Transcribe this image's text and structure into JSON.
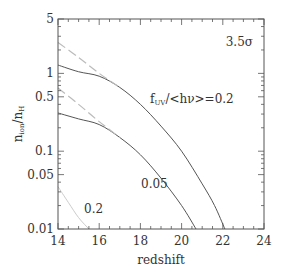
{
  "chart_data": {
    "type": "line",
    "title": "",
    "xlabel": "redshift",
    "ylabel": "n_ion/n_H",
    "xlim": [
      14,
      24
    ],
    "ylim": [
      0.01,
      5
    ],
    "yscale": "log",
    "grid": false,
    "x_ticks": [
      14,
      16,
      18,
      20,
      22,
      24
    ],
    "x_tick_labels": [
      "14",
      "16",
      "18",
      "20",
      "22",
      "24"
    ],
    "y_ticks": [
      0.01,
      0.05,
      0.1,
      0.5,
      1,
      5
    ],
    "y_tick_labels": [
      "0.01",
      "0.05",
      "0.1",
      "0.5",
      "1",
      "5"
    ],
    "annotations": {
      "sigma": "3.5σ",
      "param": "f_UV/<hν>=0.2",
      "label_005": "0.05",
      "label_02": "0.2"
    },
    "series": [
      {
        "name": "f=0.2 solid",
        "style": "solid",
        "color": "#555555",
        "x": [
          14,
          15,
          16,
          17,
          18,
          19,
          20,
          21,
          21.6,
          22.1
        ],
        "y": [
          1.28,
          1.05,
          0.92,
          0.66,
          0.4,
          0.21,
          0.1,
          0.038,
          0.02,
          0.01
        ]
      },
      {
        "name": "f=0.2 dashed",
        "style": "dashed",
        "color": "#bbbbbb",
        "x": [
          14,
          15,
          16,
          17
        ],
        "y": [
          2.5,
          1.6,
          1.0,
          0.66
        ]
      },
      {
        "name": "f=0.05 solid",
        "style": "solid",
        "color": "#555555",
        "x": [
          14,
          15,
          16,
          17,
          18,
          19,
          20,
          20.7
        ],
        "y": [
          0.31,
          0.26,
          0.22,
          0.15,
          0.09,
          0.045,
          0.02,
          0.01
        ]
      },
      {
        "name": "f=0.05 dashed",
        "style": "dashed",
        "color": "#bbbbbb",
        "x": [
          14,
          15,
          16,
          17
        ],
        "y": [
          0.65,
          0.4,
          0.24,
          0.15
        ]
      },
      {
        "name": "f=0.2 low",
        "style": "solid",
        "color": "#cccccc",
        "x": [
          14,
          14.5,
          15,
          15.5
        ],
        "y": [
          0.035,
          0.022,
          0.014,
          0.01
        ]
      }
    ]
  }
}
